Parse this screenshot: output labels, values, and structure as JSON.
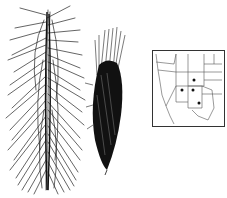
{
  "figure": {
    "panels": [
      {
        "id": "spike-left",
        "description": "Large bristly grass inflorescence (line drawing)"
      },
      {
        "id": "spike-right",
        "description": "Smaller dense dark grass spikelet cluster"
      },
      {
        "id": "range-map",
        "description": "Western US range map with distribution dots"
      }
    ],
    "map": {
      "dots": [
        {
          "x": 42,
          "y": 30
        },
        {
          "x": 30,
          "y": 40
        },
        {
          "x": 41,
          "y": 40
        },
        {
          "x": 47,
          "y": 53
        }
      ],
      "border_color": "#333333"
    },
    "colors": {
      "ink": "#1a1a1a",
      "background": "#ffffff"
    }
  }
}
